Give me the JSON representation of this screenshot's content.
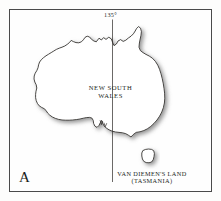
{
  "figure": {
    "panel_letter": "A",
    "background_color": "#fdfdfc",
    "frame_color": "#4a4a4a"
  },
  "map": {
    "region": "Australia",
    "coastline_color": "#2b2825",
    "land_fill": "#ffffff",
    "shadow_color": "#9a9a9a",
    "meridian_label": "135°",
    "labels": {
      "new_south_wales_line1": "NEW SOUTH",
      "new_south_wales_line2": "WALES",
      "van_diemens_land_line1": "VAN DIEMEN'S LAND",
      "van_diemens_land_line2": "(TASMANIA)"
    }
  }
}
